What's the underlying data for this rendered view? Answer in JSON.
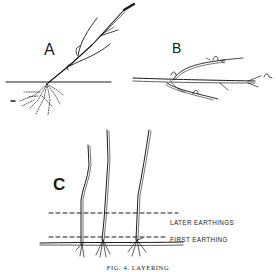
{
  "figure": {
    "caption": "FIG. 4. LAYERING",
    "panels": [
      {
        "id": "A",
        "label": "A"
      },
      {
        "id": "B",
        "label": "B"
      },
      {
        "id": "C",
        "label": "C"
      }
    ],
    "annotations": {
      "later_earthings": "LATER EARTHINGS",
      "first_earthing": "FIRST EARTHING"
    },
    "colors": {
      "ink": "#1a1a1a",
      "paper": "#ffffff"
    }
  }
}
